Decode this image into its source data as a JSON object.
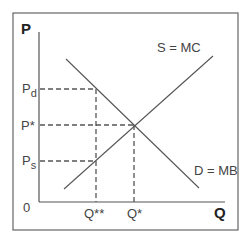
{
  "diagram": {
    "type": "supply-demand",
    "axis": {
      "y_label": "P",
      "x_label": "Q",
      "origin_label": "0"
    },
    "curves": [
      {
        "name": "supply",
        "label": "S = MC",
        "from": [
          64,
          189
        ],
        "to": [
          213,
          56
        ]
      },
      {
        "name": "demand",
        "label": "D = MB",
        "from": [
          66,
          59
        ],
        "to": [
          199,
          188
        ]
      }
    ],
    "price_levels": [
      {
        "label_main": "P",
        "label_sub": "d",
        "y": 89
      },
      {
        "label_main": "P*",
        "label_sub": "",
        "y": 125
      },
      {
        "label_main": "P",
        "label_sub": "s",
        "y": 161
      }
    ],
    "quantity_levels": [
      {
        "label": "Q**",
        "x": 96
      },
      {
        "label": "Q*",
        "x": 134
      }
    ],
    "colors": {
      "line": "#555555",
      "frame": "#666666",
      "text": "#444444"
    }
  }
}
